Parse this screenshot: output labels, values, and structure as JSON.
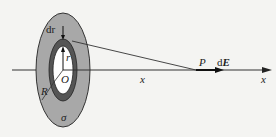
{
  "labels": {
    "dr": "dr",
    "r": "r",
    "O": "O",
    "R": "R",
    "sigma": "σ",
    "x_mid": "x",
    "P": "P",
    "dE_d": "d",
    "dE_E": "E",
    "x_axis": "x"
  },
  "colors": {
    "disk": "#a8a8a8",
    "ring": "#555555",
    "hole": "#ffffff",
    "line": "#333333"
  }
}
